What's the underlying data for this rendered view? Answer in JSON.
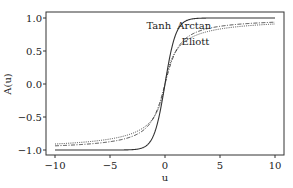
{
  "chart_data": {
    "type": "line",
    "title": "",
    "xlabel": "u",
    "ylabel": "A(u)",
    "xlim": [
      -10.8,
      10.8
    ],
    "ylim": [
      -1.08,
      1.08
    ],
    "grid": false,
    "legend": "none (inline annotations)",
    "x_ticks": [
      "−10",
      "−5",
      "0",
      "5",
      "10"
    ],
    "x_tick_values": [
      -10,
      -5,
      0,
      5,
      10
    ],
    "y_ticks": [
      "−1.0",
      "−0.5",
      "0.0",
      "0.5",
      "1.0"
    ],
    "y_tick_values": [
      -1.0,
      -0.5,
      0.0,
      0.5,
      1.0
    ],
    "x": [
      -10,
      -8,
      -6,
      -4,
      -3,
      -2,
      -1.5,
      -1,
      -0.5,
      0,
      0.5,
      1,
      1.5,
      2,
      3,
      4,
      6,
      8,
      10
    ],
    "series": [
      {
        "name": "Tanh",
        "style": "solid",
        "values": [
          -1.0,
          -1.0,
          -1.0,
          -0.999,
          -0.995,
          -0.964,
          -0.905,
          -0.762,
          -0.462,
          0.0,
          0.462,
          0.762,
          0.905,
          0.964,
          0.995,
          0.999,
          1.0,
          1.0,
          1.0
        ]
      },
      {
        "name": "Arctan",
        "style": "dash-dot",
        "values": [
          -0.937,
          -0.921,
          -0.895,
          -0.844,
          -0.795,
          -0.705,
          -0.626,
          -0.5,
          -0.295,
          0.0,
          0.295,
          0.5,
          0.626,
          0.705,
          0.795,
          0.844,
          0.895,
          0.921,
          0.937
        ]
      },
      {
        "name": "Eliott",
        "style": "dotted",
        "values": [
          -0.909,
          -0.889,
          -0.857,
          -0.8,
          -0.75,
          -0.667,
          -0.6,
          -0.5,
          -0.333,
          0.0,
          0.333,
          0.5,
          0.6,
          0.667,
          0.75,
          0.8,
          0.857,
          0.889,
          0.909
        ]
      }
    ],
    "annotations": [
      {
        "text": "Tanh",
        "x": -0.6,
        "y": 0.88
      },
      {
        "text": "Arctan",
        "x": 2.2,
        "y": 0.88
      },
      {
        "text": "Eliott",
        "x": 2.6,
        "y": 0.64
      }
    ]
  }
}
